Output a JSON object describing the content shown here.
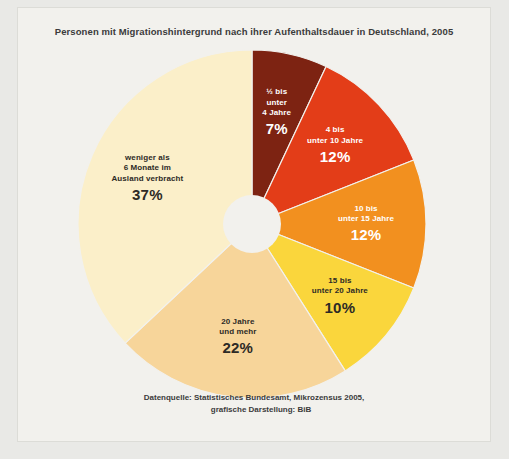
{
  "chart_title": "Personen mit Migrationshintergrund nach ihrer Aufenthaltsdauer in Deutschland, 2005",
  "source": {
    "line1": "Datenquelle: Statistisches Bundesamt, Mikrozensus 2005,",
    "line2": "grafische Darstellung: BiB"
  },
  "colors": {
    "page_background": "#e9e9e6",
    "panel_background": "#f2f1ed",
    "donut_hole": "#f2f1ed",
    "title_text": "#3b3b3b",
    "slice_1": "#7d2312",
    "slice_2": "#e33d18",
    "slice_3": "#f2901f",
    "slice_4": "#fad63c",
    "slice_5": "#f7d59a",
    "slice_6": "#fbefc9"
  },
  "chart_data": {
    "type": "pie",
    "title": "Personen mit Migrationshintergrund nach ihrer Aufenthaltsdauer in Deutschland, 2005",
    "xlabel": "",
    "ylabel": "",
    "grid": false,
    "legend_position": "none",
    "donut": true,
    "start_angle_deg": 0,
    "direction": "clockwise",
    "units": "percent",
    "categories": [
      "½ bis unter 4 Jahre",
      "4 bis unter 10 Jahre",
      "10 bis unter 15 Jahre",
      "15 bis unter 20 Jahre",
      "20 Jahre und mehr",
      "weniger als 6 Monate im Ausland verbracht"
    ],
    "values": [
      7,
      12,
      12,
      10,
      22,
      37
    ],
    "slices": [
      {
        "label_lines": [
          "½ bis",
          "unter",
          "4 Jahre"
        ],
        "value": 7,
        "value_label": "7%",
        "color": "#7d2312",
        "label_color": "light"
      },
      {
        "label_lines": [
          "4 bis",
          "unter 10 Jahre"
        ],
        "value": 12,
        "value_label": "12%",
        "color": "#e33d18",
        "label_color": "light"
      },
      {
        "label_lines": [
          "10 bis",
          "unter 15 Jahre"
        ],
        "value": 12,
        "value_label": "12%",
        "color": "#f2901f",
        "label_color": "light"
      },
      {
        "label_lines": [
          "15 bis",
          "unter 20 Jahre"
        ],
        "value": 10,
        "value_label": "10%",
        "color": "#fad63c",
        "label_color": "dark"
      },
      {
        "label_lines": [
          "20 Jahre",
          "und mehr"
        ],
        "value": 22,
        "value_label": "22%",
        "color": "#f7d59a",
        "label_color": "dark"
      },
      {
        "label_lines": [
          "weniger als",
          "6 Monate im",
          "Ausland verbracht"
        ],
        "value": 37,
        "value_label": "37%",
        "color": "#fbefc9",
        "label_color": "dark"
      }
    ]
  }
}
